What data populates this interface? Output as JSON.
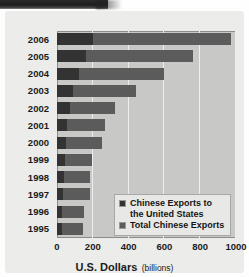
{
  "chart_data": {
    "type": "bar",
    "orientation": "horizontal",
    "title": "",
    "xlabel": "U.S. Dollars",
    "xlabel_unit": "(billions)",
    "ylabel": "",
    "xlim": [
      0,
      1000
    ],
    "xticks": [
      0,
      200,
      400,
      600,
      800,
      1000
    ],
    "xtick_labels": [
      "0",
      "200",
      "400",
      "600",
      "800",
      "1000"
    ],
    "grid": true,
    "grid_axis": "x",
    "legend_position": "inside-lower-right",
    "categories": [
      "2006",
      "2005",
      "2004",
      "2003",
      "2002",
      "2001",
      "2000",
      "1999",
      "1998",
      "1997",
      "1996",
      "1995"
    ],
    "series": [
      {
        "name": "Total Chinese Exports",
        "color": "#5c5c5c",
        "values": [
          970,
          760,
          595,
          440,
          325,
          266,
          250,
          195,
          184,
          183,
          151,
          148
        ]
      },
      {
        "name": "Chinese Exports to the United States",
        "color": "#333333",
        "values": [
          203,
          163,
          125,
          92,
          70,
          54,
          52,
          42,
          38,
          33,
          30,
          30
        ]
      }
    ]
  },
  "legend": {
    "entries": [
      {
        "label_line1": "Chinese Exports to",
        "label_line2": "the United States",
        "swatch": "dark-gray-swatch"
      },
      {
        "label_line1": "Total Chinese Exports",
        "label_line2": "",
        "swatch": "mid-gray-swatch"
      }
    ]
  },
  "axis": {
    "title_main": "U.S. Dollars",
    "title_sub": "(billions)"
  }
}
